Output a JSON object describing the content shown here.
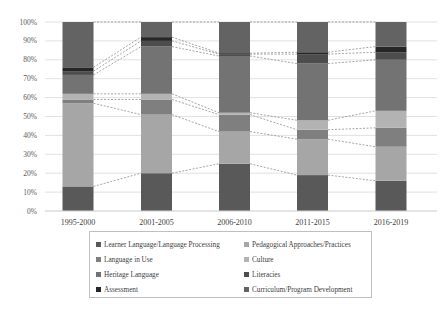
{
  "chart_data": {
    "type": "bar",
    "stacked": true,
    "normalized_percent": true,
    "title": "",
    "xlabel": "",
    "ylabel": "",
    "ylim": [
      0,
      100
    ],
    "grid": true,
    "legend_position": "bottom",
    "series_connector_lines": "dashed",
    "yticks": [
      "0%",
      "10%",
      "20%",
      "30%",
      "40%",
      "50%",
      "60%",
      "70%",
      "80%",
      "90%",
      "100%"
    ],
    "categories": [
      "1995-2000",
      "2001-2005",
      "2006-2010",
      "2011-2015",
      "2016-2019"
    ],
    "series": [
      {
        "name": "Learner Language/Language Processing",
        "color": "#595959",
        "values": [
          13,
          20,
          25,
          19,
          16
        ]
      },
      {
        "name": "Pedagogical Approaches/Practices",
        "color": "#a6a6a6",
        "values": [
          44,
          31,
          17,
          19,
          18
        ]
      },
      {
        "name": "Language in Use",
        "color": "#7f7f7f",
        "values": [
          2,
          8,
          9,
          5,
          10
        ]
      },
      {
        "name": "Culture",
        "color": "#b3b3b3",
        "values": [
          3,
          3,
          1,
          5,
          9
        ]
      },
      {
        "name": "Heritage Language",
        "color": "#737373",
        "values": [
          10,
          25,
          30,
          30,
          27
        ]
      },
      {
        "name": "Literacies",
        "color": "#4d4d4d",
        "values": [
          2,
          3,
          1,
          5,
          4
        ]
      },
      {
        "name": "Assessment",
        "color": "#262626",
        "values": [
          2,
          2,
          0.5,
          1,
          3
        ]
      },
      {
        "name": "Curriculum/Program Development",
        "color": "#636363",
        "values": [
          24,
          8,
          16.5,
          16,
          13
        ]
      }
    ]
  },
  "legend": {
    "items": [
      {
        "label": "Learner Language/Language Processing",
        "color": "#595959"
      },
      {
        "label": "Pedagogical Approaches/Practices",
        "color": "#a6a6a6"
      },
      {
        "label": "Language in Use",
        "color": "#7f7f7f"
      },
      {
        "label": "Culture",
        "color": "#b3b3b3"
      },
      {
        "label": "Heritage Language",
        "color": "#737373"
      },
      {
        "label": "Literacies",
        "color": "#4d4d4d"
      },
      {
        "label": "Assessment",
        "color": "#262626"
      },
      {
        "label": "Curriculum/Program Development",
        "color": "#636363"
      }
    ]
  }
}
